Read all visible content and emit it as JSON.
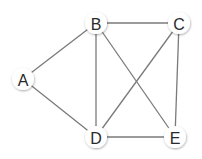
{
  "graph": {
    "nodes": [
      {
        "id": "A",
        "label": "A",
        "x": 23,
        "y": 79
      },
      {
        "id": "B",
        "label": "B",
        "x": 96,
        "y": 23
      },
      {
        "id": "C",
        "label": "C",
        "x": 179,
        "y": 23
      },
      {
        "id": "D",
        "label": "D",
        "x": 96,
        "y": 137
      },
      {
        "id": "E",
        "label": "E",
        "x": 175,
        "y": 137
      }
    ],
    "edges": [
      [
        "A",
        "B"
      ],
      [
        "A",
        "D"
      ],
      [
        "B",
        "C"
      ],
      [
        "B",
        "D"
      ],
      [
        "B",
        "E"
      ],
      [
        "C",
        "D"
      ],
      [
        "C",
        "E"
      ],
      [
        "D",
        "E"
      ]
    ],
    "colors": {
      "edge": "#7a7a7a",
      "node_fill": "#ffffff",
      "label": "#2a2a2a"
    }
  }
}
